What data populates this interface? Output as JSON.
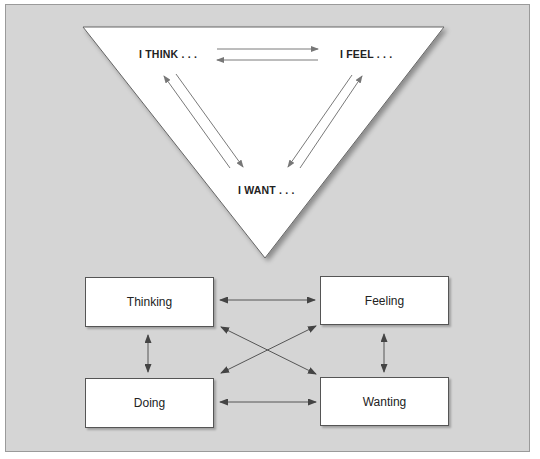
{
  "triangle": {
    "labels": {
      "think": "I THINK . . .",
      "feel": "I FEEL . . .",
      "want": "I WANT . . ."
    },
    "fill": "#ffffff",
    "arrow_color": "#777777"
  },
  "boxes": {
    "thinking": "Thinking",
    "feeling": "Feeling",
    "doing": "Doing",
    "wanting": "Wanting"
  },
  "colors": {
    "background": "#d5d5d5",
    "box_fill": "#ffffff",
    "box_border": "#555555",
    "arrow": "#555555"
  },
  "connections": [
    {
      "from": "Thinking",
      "to": "Feeling",
      "type": "bidirectional"
    },
    {
      "from": "Thinking",
      "to": "Doing",
      "type": "bidirectional"
    },
    {
      "from": "Thinking",
      "to": "Wanting",
      "type": "bidirectional"
    },
    {
      "from": "Feeling",
      "to": "Doing",
      "type": "bidirectional"
    },
    {
      "from": "Feeling",
      "to": "Wanting",
      "type": "bidirectional"
    },
    {
      "from": "Doing",
      "to": "Wanting",
      "type": "bidirectional"
    }
  ]
}
